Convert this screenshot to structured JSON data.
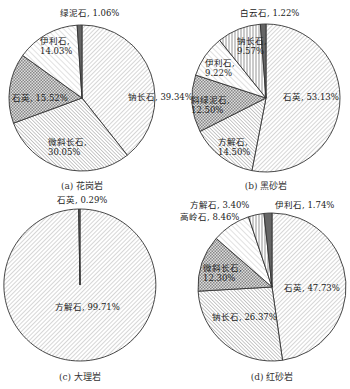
{
  "chart_data": [
    {
      "type": "pie",
      "title": "(a) 花岗岩",
      "center": [
        82,
        98
      ],
      "radius": 73,
      "slices": [
        {
          "label": "钠长石",
          "value": 39.34,
          "text": "钠长石, 39.34%",
          "pattern": "diag-fine",
          "lx": 128,
          "ly": 100
        },
        {
          "label": "微斜长石",
          "value": 30.05,
          "text": "微斜长石, 30.05%",
          "pattern": "diag-back",
          "lx": 48,
          "ly": 145,
          "multiline": true
        },
        {
          "label": "石英",
          "value": 15.52,
          "text": "石英, 15.52%",
          "pattern": "cross",
          "lx": 12,
          "ly": 101
        },
        {
          "label": "伊利石",
          "value": 14.03,
          "text": "伊利石, 14.03%",
          "pattern": "diag-light",
          "lx": 40,
          "ly": 44,
          "multiline": true
        },
        {
          "label": "绿泥石",
          "value": 1.06,
          "text": "绿泥石, 1.06%",
          "pattern": "dark",
          "lx": 60,
          "ly": 16
        }
      ],
      "start_offset": 0
    },
    {
      "type": "pie",
      "title": "(b) 黑砂岩",
      "center": [
        266,
        98
      ],
      "radius": 74,
      "slices": [
        {
          "label": "石英",
          "value": 53.13,
          "text": "石英, 53.13%",
          "pattern": "diag-fine",
          "lx": 283,
          "ly": 100
        },
        {
          "label": "方解石",
          "value": 14.5,
          "text": "方解石, 14.50%",
          "pattern": "diag-back",
          "lx": 218,
          "ly": 145,
          "multiline": true
        },
        {
          "label": "斜绿泥石",
          "value": 12.5,
          "text": "斜绿泥石, 12.50%",
          "pattern": "cross",
          "lx": 191,
          "ly": 103,
          "multiline": true
        },
        {
          "label": "伊利石",
          "value": 9.22,
          "text": "伊利石, 9.22%",
          "pattern": "diag-light",
          "lx": 205,
          "ly": 66,
          "multiline": true
        },
        {
          "label": "钠长石",
          "value": 9.57,
          "text": "钠长石, 9.57%",
          "pattern": "vertical",
          "lx": 237,
          "ly": 44,
          "multiline": true
        },
        {
          "label": "白云石",
          "value": 1.22,
          "text": "白云石, 1.22%",
          "pattern": "dark",
          "lx": 240,
          "ly": 16
        }
      ],
      "start_offset": 0
    },
    {
      "type": "pie",
      "title": "(c) 大理岩",
      "center": [
        80,
        285
      ],
      "radius": 76,
      "slices": [
        {
          "label": "方解石",
          "value": 99.71,
          "text": "方解石, 99.71%",
          "pattern": "diag-fine",
          "lx": 55,
          "ly": 310
        },
        {
          "label": "石英",
          "value": 0.29,
          "text": "石英, 0.29%",
          "pattern": "dark",
          "lx": 57,
          "ly": 203
        }
      ],
      "start_offset": 0
    },
    {
      "type": "pie",
      "title": "(d) 红砂岩",
      "center": [
        272,
        287
      ],
      "radius": 74,
      "slices": [
        {
          "label": "石英",
          "value": 47.73,
          "text": "石英, 47.73%",
          "pattern": "diag-fine",
          "lx": 284,
          "ly": 291
        },
        {
          "label": "钠长石",
          "value": 26.37,
          "text": "钠长石, 26.37%",
          "pattern": "diag-back",
          "lx": 212,
          "ly": 320
        },
        {
          "label": "微斜长石",
          "value": 12.3,
          "text": "微斜长石, 12.30%",
          "pattern": "cross",
          "lx": 203,
          "ly": 271,
          "multiline": true
        },
        {
          "label": "高岭石",
          "value": 8.46,
          "text": "高岭石, 8.46%",
          "pattern": "diag-light",
          "lx": 180,
          "ly": 220
        },
        {
          "label": "方解石",
          "value": 3.4,
          "text": "方解石, 3.40%",
          "pattern": "vertical",
          "lx": 190,
          "ly": 208
        },
        {
          "label": "伊利石",
          "value": 1.74,
          "text": "伊利石, 1.74%",
          "pattern": "dark",
          "lx": 275,
          "ly": 208
        }
      ],
      "start_offset": 0
    }
  ],
  "captions": [
    "(a) 花岗岩",
    "(b) 黑砂岩",
    "(c) 大理岩",
    "(d) 红砂岩"
  ]
}
